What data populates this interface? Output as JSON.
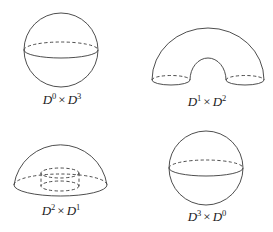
{
  "figure": {
    "panels": [
      {
        "id": "d0xd3",
        "shape": "sphere",
        "label": {
          "base1": "D",
          "exp1": "0",
          "times": "×",
          "base2": "D",
          "exp2": "3"
        }
      },
      {
        "id": "d1xd2",
        "shape": "solid-arch (bent cylinder / half solid torus)",
        "label": {
          "base1": "D",
          "exp1": "1",
          "times": "×",
          "base2": "D",
          "exp2": "2"
        }
      },
      {
        "id": "d2xd1",
        "shape": "hemisphere with inner dashed cylinder",
        "label": {
          "base1": "D",
          "exp1": "2",
          "times": "×",
          "base2": "D",
          "exp2": "1"
        }
      },
      {
        "id": "d3xd0",
        "shape": "sphere",
        "label": {
          "base1": "D",
          "exp1": "3",
          "times": "×",
          "base2": "D",
          "exp2": "0"
        }
      }
    ],
    "colors": {
      "stroke": "#3a3a3a",
      "text": "#222222",
      "background": "#ffffff"
    }
  }
}
